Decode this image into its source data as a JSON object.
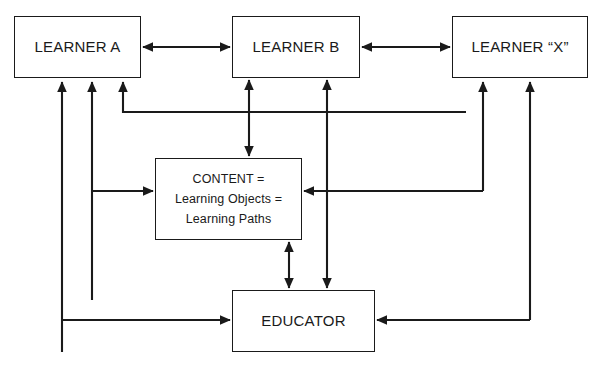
{
  "diagram": {
    "stroke_color": "#1a1a1a",
    "background_color": "#ffffff",
    "nodes": [
      {
        "id": "learner_a",
        "label": "LEARNER A",
        "x": 14,
        "y": 16,
        "w": 127,
        "h": 62
      },
      {
        "id": "learner_b",
        "label": "LEARNER B",
        "x": 232,
        "y": 16,
        "w": 128,
        "h": 62
      },
      {
        "id": "learner_x",
        "label": "LEARNER “X”",
        "x": 452,
        "y": 16,
        "w": 136,
        "h": 62
      },
      {
        "id": "content",
        "label_line1": "CONTENT =",
        "label_line2": "Learning Objects =",
        "label_line3": "Learning Paths",
        "x": 155,
        "y": 158,
        "w": 147,
        "h": 82
      },
      {
        "id": "educator",
        "label": "EDUCATOR",
        "x": 232,
        "y": 290,
        "w": 143,
        "h": 62
      }
    ],
    "edges": [
      {
        "id": "learner-a-to-learner-b",
        "type": "double",
        "orientation": "horizontal"
      },
      {
        "id": "learner-b-to-learner-x",
        "type": "double",
        "orientation": "horizontal"
      },
      {
        "id": "learner-b-to-content",
        "type": "double",
        "orientation": "vertical"
      },
      {
        "id": "content-to-educator",
        "type": "double",
        "orientation": "vertical"
      },
      {
        "id": "learner-b-to-educator",
        "type": "double",
        "orientation": "vertical"
      },
      {
        "id": "educator-to-learner-a",
        "type": "single",
        "orientation": "elbow"
      },
      {
        "id": "content-to-learner-a",
        "type": "single",
        "orientation": "elbow"
      },
      {
        "id": "learner-x-to-learner-a",
        "type": "single",
        "orientation": "elbow"
      },
      {
        "id": "learner-a-to-content",
        "type": "single",
        "orientation": "elbow"
      },
      {
        "id": "learner-b-to-learner-x-lower",
        "type": "single",
        "orientation": "elbow"
      },
      {
        "id": "content-from-right",
        "type": "single",
        "orientation": "elbow"
      },
      {
        "id": "educator-to-learner-x",
        "type": "single",
        "orientation": "elbow"
      },
      {
        "id": "learner-a-to-educator",
        "type": "single",
        "orientation": "elbow"
      },
      {
        "id": "learner-x-to-educator",
        "type": "single",
        "orientation": "elbow"
      }
    ]
  }
}
